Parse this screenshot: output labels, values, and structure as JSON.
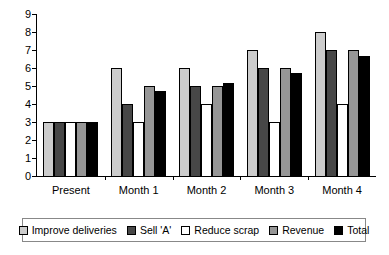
{
  "chart_data": {
    "type": "bar",
    "title": "",
    "subtitle": "",
    "xlabel": "",
    "ylabel": "",
    "ylim": [
      0,
      9
    ],
    "y_ticks": [
      0,
      1,
      2,
      3,
      4,
      5,
      6,
      7,
      8,
      9
    ],
    "grid": false,
    "legend_position": "bottom",
    "categories": [
      "Present",
      "Month 1",
      "Month 2",
      "Month 3",
      "Month 4"
    ],
    "series": [
      {
        "name": "Improve deliveries",
        "color": "#cccccc",
        "values": [
          3,
          6,
          6,
          7,
          8
        ]
      },
      {
        "name": "Sell 'A'",
        "color": "#474747",
        "values": [
          3,
          4,
          5,
          6,
          7
        ]
      },
      {
        "name": "Reduce scrap",
        "color": "#ffffff",
        "values": [
          3,
          3,
          4,
          3,
          4
        ]
      },
      {
        "name": "Revenue",
        "color": "#969696",
        "values": [
          3,
          5,
          5,
          6,
          7
        ]
      },
      {
        "name": "Total",
        "color": "#000000",
        "values": [
          3,
          4.75,
          5.15,
          5.7,
          6.65
        ]
      }
    ]
  },
  "legend": {
    "items": [
      {
        "label": "Improve deliveries",
        "swatch": "#cccccc"
      },
      {
        "label": "Sell 'A'",
        "swatch": "#474747"
      },
      {
        "label": "Reduce scrap",
        "swatch": "#ffffff"
      },
      {
        "label": "Revenue",
        "swatch": "#969696"
      },
      {
        "label": "Total",
        "swatch": "#000000"
      }
    ]
  }
}
